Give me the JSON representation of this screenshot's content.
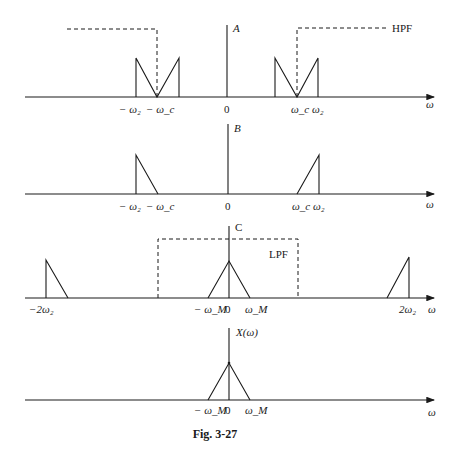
{
  "figure": {
    "caption": "Fig. 3-27",
    "axis_symbol": "ω"
  },
  "panels": [
    {
      "id": "A",
      "title": "A",
      "filter_label": "HPF",
      "ticks": {
        "neg_w2": "− ω₂",
        "neg_wc": "− ω_c",
        "zero": "0",
        "wc": "ω_c",
        "w2": "ω₂"
      }
    },
    {
      "id": "B",
      "title": "B",
      "ticks": {
        "neg_w2": "− ω₂",
        "neg_wc": "− ω_c",
        "zero": "0",
        "wc": "ω_c",
        "w2": "ω₂"
      }
    },
    {
      "id": "C",
      "title": "C",
      "filter_label": "LPF",
      "ticks": {
        "neg_2w2": "−2ω₂",
        "neg_wM": "− ω_M",
        "zero": "0",
        "wM": "ω_M",
        "pos_2w2": "2ω₂"
      }
    },
    {
      "id": "X",
      "title": "X(ω)",
      "ticks": {
        "neg_wM": "− ω_M",
        "zero": "0",
        "wM": "ω_M"
      }
    }
  ]
}
